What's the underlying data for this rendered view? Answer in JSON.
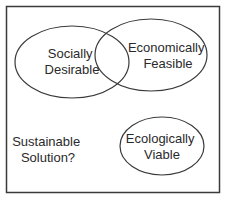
{
  "diagram": {
    "type": "venn",
    "frame": {
      "x": 6,
      "y": 6,
      "width": 214,
      "height": 187,
      "stroke": "#3a3a3a"
    },
    "circles": [
      {
        "id": "social",
        "line1": "Socially",
        "line2": "Desirable",
        "cx": 72,
        "cy": 62,
        "rx": 57,
        "ry": 36
      },
      {
        "id": "economic",
        "line1": "Economically",
        "line2": "Feasible",
        "cx": 151,
        "cy": 55,
        "rx": 56,
        "ry": 36
      },
      {
        "id": "ecological",
        "line1": "Ecologically",
        "line2": "Viable",
        "cx": 162,
        "cy": 146,
        "rx": 42,
        "ry": 29
      }
    ],
    "free_label": {
      "line1": "Sustainable",
      "line2": "Solution?"
    },
    "stroke_color": "#3a3a3a",
    "text_color": "#2a2a2a"
  }
}
